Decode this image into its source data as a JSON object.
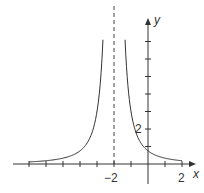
{
  "chart_data": {
    "type": "line",
    "title": "",
    "xlabel": "x",
    "ylabel": "y",
    "function": "y = 3/(x+2)^2",
    "vertical_asymptote": -2,
    "xlim": [
      -7.5,
      2.5
    ],
    "ylim": [
      -1,
      8
    ],
    "x_ticks": [
      -7,
      -6,
      -5,
      -4,
      -3,
      -2,
      -1,
      0,
      1,
      2
    ],
    "y_ticks": [
      1,
      2,
      3,
      4,
      5,
      6,
      7
    ],
    "x_tick_labels": {
      "-2": "−2",
      "2": "2"
    },
    "y_tick_labels": {
      "2": "2"
    },
    "series": [
      {
        "name": "left branch",
        "x": [
          -7,
          -6,
          -5,
          -4,
          -3,
          -2.65
        ],
        "y": [
          0.12,
          0.19,
          0.33,
          0.75,
          3.0,
          7.1
        ]
      },
      {
        "name": "right branch",
        "x": [
          -1.35,
          -1,
          0,
          1,
          2
        ],
        "y": [
          7.1,
          3.0,
          0.75,
          0.33,
          0.19
        ]
      }
    ],
    "grid": false,
    "legend": null
  },
  "labels": {
    "x_axis": "x",
    "y_axis": "y",
    "x_tick_neg2": "−2",
    "x_tick_2": "2",
    "y_tick_2": "2"
  }
}
